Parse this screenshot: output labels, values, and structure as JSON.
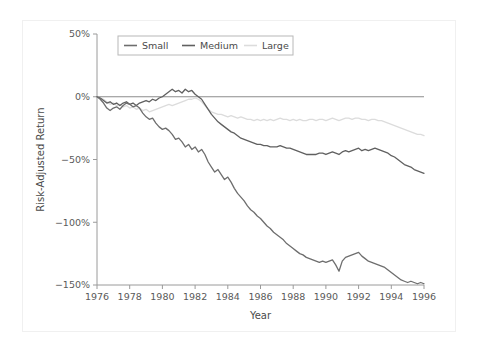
{
  "figure": {
    "background_color": "#ffffff",
    "frame_color": "#f0f0f0"
  },
  "chart_data": {
    "type": "line",
    "title": "",
    "xlabel": "Year",
    "ylabel": "Risk-Adjusted Return",
    "xlim": [
      1976,
      1996
    ],
    "ylim": [
      -150,
      50
    ],
    "xticks": [
      1976,
      1978,
      1980,
      1982,
      1984,
      1986,
      1988,
      1990,
      1992,
      1994,
      1996
    ],
    "xtick_labels": [
      "1976",
      "1978",
      "1980",
      "1982",
      "1984",
      "1986",
      "1988",
      "1990",
      "1992",
      "1994",
      "1996"
    ],
    "yticks": [
      50,
      0,
      -50,
      -100,
      -150
    ],
    "ytick_labels": [
      "50%",
      "0%",
      "−50%",
      "−100%",
      "−150%"
    ],
    "grid": false,
    "zero_line": true,
    "legend_position": "top-left-inside",
    "legend_entries": [
      "Small",
      "Medium",
      "Large"
    ],
    "series": [
      {
        "name": "Small",
        "color": "#6e6e6e",
        "x": [
          1976.0,
          1976.2,
          1976.4,
          1976.6,
          1976.8,
          1977.0,
          1977.2,
          1977.4,
          1977.6,
          1977.8,
          1978.0,
          1978.2,
          1978.4,
          1978.6,
          1978.8,
          1979.0,
          1979.2,
          1979.4,
          1979.6,
          1979.8,
          1980.0,
          1980.2,
          1980.4,
          1980.6,
          1980.8,
          1981.0,
          1981.2,
          1981.4,
          1981.6,
          1981.8,
          1982.0,
          1982.2,
          1982.4,
          1982.6,
          1982.8,
          1983.0,
          1983.2,
          1983.4,
          1983.6,
          1983.8,
          1984.0,
          1984.2,
          1984.4,
          1984.6,
          1984.8,
          1985.0,
          1985.2,
          1985.4,
          1985.6,
          1985.8,
          1986.0,
          1986.2,
          1986.4,
          1986.6,
          1986.8,
          1987.0,
          1987.2,
          1987.4,
          1987.6,
          1987.8,
          1988.0,
          1988.2,
          1988.4,
          1988.6,
          1988.8,
          1989.0,
          1989.2,
          1989.4,
          1989.6,
          1989.8,
          1990.0,
          1990.2,
          1990.4,
          1990.6,
          1990.8,
          1991.0,
          1991.2,
          1991.4,
          1991.6,
          1991.8,
          1992.0,
          1992.2,
          1992.4,
          1992.6,
          1992.8,
          1993.0,
          1993.2,
          1993.4,
          1993.6,
          1993.8,
          1994.0,
          1994.2,
          1994.4,
          1994.6,
          1994.8,
          1995.0,
          1995.2,
          1995.4,
          1995.6,
          1995.8,
          1996.0
        ],
        "y": [
          0,
          -2,
          -5,
          -9,
          -11,
          -9,
          -8,
          -10,
          -7,
          -5,
          -6,
          -8,
          -7,
          -9,
          -13,
          -16,
          -18,
          -17,
          -21,
          -24,
          -26,
          -25,
          -27,
          -30,
          -34,
          -33,
          -36,
          -40,
          -38,
          -42,
          -40,
          -44,
          -42,
          -46,
          -52,
          -56,
          -60,
          -58,
          -62,
          -66,
          -64,
          -68,
          -73,
          -77,
          -80,
          -83,
          -87,
          -90,
          -92,
          -95,
          -97,
          -100,
          -103,
          -105,
          -108,
          -110,
          -112,
          -114,
          -117,
          -119,
          -121,
          -123,
          -125,
          -126,
          -128,
          -129,
          -130,
          -131,
          -132,
          -131,
          -132,
          -131,
          -130,
          -134,
          -139,
          -131,
          -128,
          -127,
          -126,
          -125,
          -124,
          -127,
          -129,
          -131,
          -132,
          -133,
          -134,
          -135,
          -136,
          -138,
          -140,
          -142,
          -144,
          -146,
          -147,
          -148,
          -147,
          -148,
          -149,
          -148,
          -149
        ]
      },
      {
        "name": "Medium",
        "color": "#606060",
        "x": [
          1976.0,
          1976.2,
          1976.4,
          1976.6,
          1976.8,
          1977.0,
          1977.2,
          1977.4,
          1977.6,
          1977.8,
          1978.0,
          1978.2,
          1978.4,
          1978.6,
          1978.8,
          1979.0,
          1979.2,
          1979.4,
          1979.6,
          1979.8,
          1980.0,
          1980.2,
          1980.4,
          1980.6,
          1980.8,
          1981.0,
          1981.2,
          1981.4,
          1981.6,
          1981.8,
          1982.0,
          1982.2,
          1982.4,
          1982.6,
          1982.8,
          1983.0,
          1983.2,
          1983.4,
          1983.6,
          1983.8,
          1984.0,
          1984.2,
          1984.4,
          1984.6,
          1984.8,
          1985.0,
          1985.2,
          1985.4,
          1985.6,
          1985.8,
          1986.0,
          1986.2,
          1986.4,
          1986.6,
          1986.8,
          1987.0,
          1987.2,
          1987.4,
          1987.6,
          1987.8,
          1988.0,
          1988.2,
          1988.4,
          1988.6,
          1988.8,
          1989.0,
          1989.2,
          1989.4,
          1989.6,
          1989.8,
          1990.0,
          1990.2,
          1990.4,
          1990.6,
          1990.8,
          1991.0,
          1991.2,
          1991.4,
          1991.6,
          1991.8,
          1992.0,
          1992.2,
          1992.4,
          1992.6,
          1992.8,
          1993.0,
          1993.2,
          1993.4,
          1993.6,
          1993.8,
          1994.0,
          1994.2,
          1994.4,
          1994.6,
          1994.8,
          1995.0,
          1995.2,
          1995.4,
          1995.6,
          1995.8,
          1996.0
        ],
        "y": [
          0,
          -1,
          -3,
          -5,
          -4,
          -6,
          -5,
          -7,
          -5,
          -4,
          -6,
          -5,
          -7,
          -5,
          -4,
          -3,
          -4,
          -2,
          -3,
          -1,
          0,
          2,
          4,
          6,
          4,
          5,
          3,
          6,
          4,
          5,
          2,
          0,
          -2,
          -6,
          -10,
          -14,
          -17,
          -20,
          -22,
          -24,
          -26,
          -28,
          -29,
          -31,
          -33,
          -34,
          -35,
          -36,
          -37,
          -38,
          -38,
          -39,
          -39,
          -40,
          -40,
          -40,
          -39,
          -40,
          -41,
          -41,
          -42,
          -43,
          -44,
          -45,
          -46,
          -46,
          -46,
          -46,
          -45,
          -45,
          -46,
          -45,
          -44,
          -45,
          -46,
          -44,
          -43,
          -44,
          -43,
          -42,
          -41,
          -43,
          -42,
          -43,
          -42,
          -41,
          -42,
          -43,
          -44,
          -45,
          -47,
          -48,
          -50,
          -52,
          -54,
          -55,
          -56,
          -58,
          -59,
          -60,
          -61
        ]
      },
      {
        "name": "Large",
        "color": "#dcdcdc",
        "x": [
          1976.0,
          1976.2,
          1976.4,
          1976.6,
          1976.8,
          1977.0,
          1977.2,
          1977.4,
          1977.6,
          1977.8,
          1978.0,
          1978.2,
          1978.4,
          1978.6,
          1978.8,
          1979.0,
          1979.2,
          1979.4,
          1979.6,
          1979.8,
          1980.0,
          1980.2,
          1980.4,
          1980.6,
          1980.8,
          1981.0,
          1981.2,
          1981.4,
          1981.6,
          1981.8,
          1982.0,
          1982.2,
          1982.4,
          1982.6,
          1982.8,
          1983.0,
          1983.2,
          1983.4,
          1983.6,
          1983.8,
          1984.0,
          1984.2,
          1984.4,
          1984.6,
          1984.8,
          1985.0,
          1985.2,
          1985.4,
          1985.6,
          1985.8,
          1986.0,
          1986.2,
          1986.4,
          1986.6,
          1986.8,
          1987.0,
          1987.2,
          1987.4,
          1987.6,
          1987.8,
          1988.0,
          1988.2,
          1988.4,
          1988.6,
          1988.8,
          1989.0,
          1989.2,
          1989.4,
          1989.6,
          1989.8,
          1990.0,
          1990.2,
          1990.4,
          1990.6,
          1990.8,
          1991.0,
          1991.2,
          1991.4,
          1991.6,
          1991.8,
          1992.0,
          1992.2,
          1992.4,
          1992.6,
          1992.8,
          1993.0,
          1993.2,
          1993.4,
          1993.6,
          1993.8,
          1994.0,
          1994.2,
          1994.4,
          1994.6,
          1994.8,
          1995.0,
          1995.2,
          1995.4,
          1995.6,
          1995.8,
          1996.0
        ],
        "y": [
          0,
          -1,
          -2,
          -4,
          -6,
          -5,
          -7,
          -6,
          -8,
          -7,
          -9,
          -8,
          -10,
          -9,
          -11,
          -10,
          -12,
          -11,
          -10,
          -9,
          -8,
          -7,
          -6,
          -7,
          -6,
          -5,
          -4,
          -3,
          -2,
          -2,
          -1,
          -2,
          -4,
          -7,
          -10,
          -12,
          -13,
          -14,
          -14,
          -15,
          -16,
          -15,
          -16,
          -17,
          -16,
          -17,
          -18,
          -18,
          -19,
          -18,
          -19,
          -18,
          -19,
          -18,
          -19,
          -18,
          -17,
          -18,
          -18,
          -19,
          -18,
          -19,
          -18,
          -19,
          -19,
          -18,
          -18,
          -19,
          -18,
          -18,
          -19,
          -18,
          -17,
          -18,
          -19,
          -18,
          -17,
          -17,
          -18,
          -17,
          -17,
          -18,
          -18,
          -19,
          -18,
          -18,
          -19,
          -19,
          -20,
          -21,
          -22,
          -23,
          -24,
          -25,
          -26,
          -27,
          -28,
          -29,
          -30,
          -30,
          -31
        ]
      }
    ]
  }
}
